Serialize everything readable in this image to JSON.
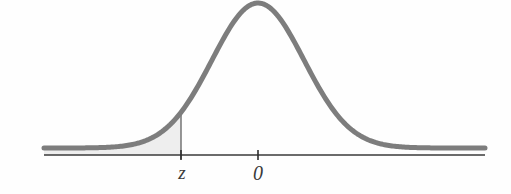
{
  "figure": {
    "kind": "normal-distribution-curve",
    "background_color": "#fefefe",
    "curve_color": "#7d7d7d",
    "curve_width_px": 5,
    "axis_color": "#3a3a3a",
    "axis_width_px": 1.6,
    "shade_fill_color": "#eeeeee",
    "shade_edge_color": "#6b6b6b",
    "tick_color": "#2e2e2e",
    "label_color": "#3a3a3a"
  },
  "axis": {
    "baseline_y": 155,
    "x_start": 44,
    "x_end": 485,
    "ticks": [
      {
        "name": "z-tick",
        "x": 181,
        "label": "z"
      },
      {
        "name": "zero-tick",
        "x": 258,
        "label": "0"
      }
    ]
  },
  "labels": {
    "z": "z",
    "zero": "0"
  },
  "chart_data": {
    "type": "line",
    "title": "",
    "subtitle": "",
    "xlabel": "",
    "ylabel": "",
    "legend": [],
    "grid": false,
    "curve": "standard normal density",
    "mean": 0,
    "sd": 1,
    "x_tick_values": [
      -1.67,
      0
    ],
    "x_tick_labels": [
      "z",
      "0"
    ],
    "shaded_region": {
      "name": "left-tail-area",
      "from": "-infinity",
      "to": "z",
      "fill": "#eeeeee",
      "description": "cumulative area to the left of z"
    },
    "pixel_geometry": {
      "peak_x": 258,
      "peak_y": 3,
      "baseline_y": 148,
      "sigma_px": 46,
      "z_line_x": 181,
      "z_curve_y": 90,
      "x_domain_px": [
        44,
        485
      ]
    },
    "annotations": [
      {
        "text": "z",
        "x_px": 181,
        "y_px": 176
      },
      {
        "text": "0",
        "x_px": 258,
        "y_px": 176
      }
    ]
  }
}
